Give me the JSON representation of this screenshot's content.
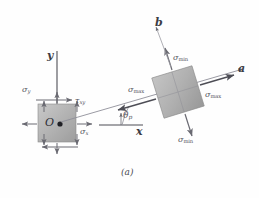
{
  "figure": {
    "caption": "(a)",
    "kind": "principal-stress-transformation-diagram",
    "background_color": "#fefefe",
    "ink_color": "#55555e",
    "element_fill_light": "#d8d8d8",
    "element_fill_dark": "#a9a9a9"
  },
  "axes": {
    "y_label": "y",
    "x_label": "x",
    "a_label": "a",
    "b_label": "b",
    "angle_label": "θ",
    "angle_sub": "p"
  },
  "original_element": {
    "origin_label": "O",
    "sigma_y": {
      "glyph": "σ",
      "sub": "y"
    },
    "sigma_x": {
      "glyph": "σ",
      "sub": "x"
    },
    "tau_xy": {
      "glyph": "τ",
      "sub": "xy"
    }
  },
  "rotated_element": {
    "sigma_max_right": {
      "glyph": "σ",
      "sub": "max"
    },
    "sigma_max_left": {
      "glyph": "σ",
      "sub": "max"
    },
    "sigma_min_top": {
      "glyph": "σ",
      "sub": "min"
    },
    "sigma_min_bottom": {
      "glyph": "σ",
      "sub": "min"
    }
  }
}
